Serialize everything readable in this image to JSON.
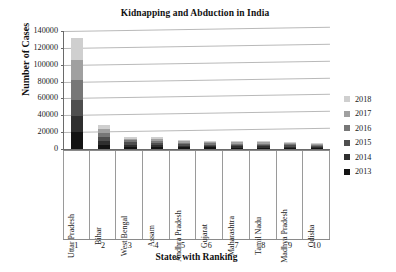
{
  "chart_data": {
    "type": "bar",
    "subtype": "stacked-column",
    "title": "Kidnapping and Abduction in India",
    "xlabel": "States with Ranking",
    "ylabel": "Number of Cases",
    "ylim": [
      0,
      140000
    ],
    "ytick_labels": [
      "140000",
      "120000",
      "100000",
      "80000",
      "60000",
      "40000",
      "20000",
      "0"
    ],
    "ytick_values": [
      140000,
      120000,
      100000,
      80000,
      60000,
      40000,
      20000,
      0
    ],
    "grid": true,
    "legend_position": "right",
    "categories": [
      "Uttar Pradesh",
      "Bihar",
      "West Bengal",
      "Assam",
      "Andhra Pradesh",
      "Gujarat",
      "Maharashtra",
      "Tamil Nadu",
      "Madhya Pradesh",
      "Odisha"
    ],
    "ranks": [
      "1",
      "2",
      "3",
      "4",
      "5",
      "6",
      "7",
      "8",
      "9",
      "10"
    ],
    "series": [
      {
        "name": "2013",
        "color": "#131313",
        "values": [
          20500,
          5200,
          2700,
          2600,
          1900,
          1800,
          1700,
          1700,
          1500,
          1300
        ]
      },
      {
        "name": "2014",
        "color": "#2f2f2f",
        "values": [
          19000,
          4800,
          2600,
          2500,
          1850,
          1750,
          1650,
          1650,
          1450,
          1250
        ]
      },
      {
        "name": "2015",
        "color": "#4e4e4e",
        "values": [
          18500,
          4600,
          2500,
          2400,
          1800,
          1700,
          1600,
          1600,
          1400,
          1200
        ]
      },
      {
        "name": "2016",
        "color": "#777777",
        "values": [
          23500,
          4600,
          2400,
          2300,
          1750,
          1650,
          1550,
          1550,
          1350,
          1150
        ]
      },
      {
        "name": "2017",
        "color": "#a0a0a0",
        "values": [
          24500,
          4500,
          2300,
          2200,
          1700,
          1600,
          1500,
          1500,
          1300,
          1100
        ]
      },
      {
        "name": "2018",
        "color": "#cfcfcf",
        "values": [
          26000,
          4300,
          2200,
          2100,
          1650,
          1550,
          1450,
          1450,
          1250,
          1050
        ]
      }
    ],
    "totals": [
      132000,
      28000,
      14700,
      14100,
      10650,
      10050,
      9450,
      9450,
      8250,
      7050
    ],
    "legend_order": [
      "2018",
      "2017",
      "2016",
      "2015",
      "2014",
      "2013"
    ]
  }
}
